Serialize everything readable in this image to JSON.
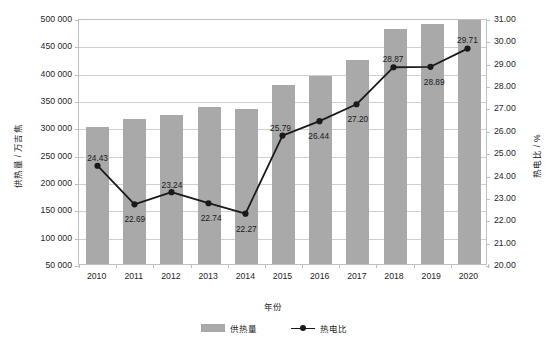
{
  "chart_data": {
    "type": "bar",
    "title": "",
    "xlabel": "年份",
    "ylabel": "供热量 / 万吉焦",
    "y2label": "热电比 / %",
    "categories": [
      "2010",
      "2011",
      "2012",
      "2013",
      "2014",
      "2015",
      "2016",
      "2017",
      "2018",
      "2019",
      "2020"
    ],
    "series": [
      {
        "name": "供热量",
        "type": "bar",
        "axis": "left",
        "color": "#a9a9a9",
        "values": [
          300000,
          315000,
          322000,
          338000,
          334000,
          377000,
          394000,
          424000,
          480000,
          489000,
          497000
        ]
      },
      {
        "name": "热电比",
        "type": "line",
        "axis": "right",
        "color": "#1a1a1a",
        "values": [
          24.43,
          22.69,
          23.24,
          22.74,
          22.27,
          25.79,
          26.44,
          27.2,
          28.87,
          28.89,
          29.71
        ],
        "labels": [
          "24.43",
          "22.69",
          "23.24",
          "22.74",
          "22.27",
          "25.79",
          "26.44",
          "27.20",
          "28.87",
          "28.89",
          "29.71"
        ]
      }
    ],
    "ylim": [
      50000,
      500000
    ],
    "y2lim": [
      20.0,
      31.0
    ],
    "yticks": [
      "50 000",
      "100 000",
      "150 000",
      "200 000",
      "250 000",
      "300 000",
      "350 000",
      "400 000",
      "450 000",
      "500 000"
    ],
    "ytick_values": [
      50000,
      100000,
      150000,
      200000,
      250000,
      300000,
      350000,
      400000,
      450000,
      500000
    ],
    "y2ticks": [
      "20.00",
      "21.00",
      "22.00",
      "23.00",
      "24.00",
      "25.00",
      "26.00",
      "27.00",
      "28.00",
      "29.00",
      "30.00",
      "31.00"
    ],
    "y2tick_values": [
      20,
      21,
      22,
      23,
      24,
      25,
      26,
      27,
      28,
      29,
      30,
      31
    ],
    "grid": true,
    "legend_position": "bottom",
    "legend": [
      "供热量",
      "热电比"
    ]
  },
  "point_label_offsets": [
    {
      "dx": 0,
      "dy": -13
    },
    {
      "dx": 0,
      "dy": 9
    },
    {
      "dx": 0,
      "dy": -13
    },
    {
      "dx": 2,
      "dy": 9
    },
    {
      "dx": 0,
      "dy": 10
    },
    {
      "dx": -3,
      "dy": -13
    },
    {
      "dx": -2,
      "dy": 10
    },
    {
      "dx": 0,
      "dy": 10
    },
    {
      "dx": -2,
      "dy": -13
    },
    {
      "dx": 2,
      "dy": 11
    },
    {
      "dx": -2,
      "dy": -13
    }
  ],
  "colors": {
    "bar": "#a9a9a9",
    "line": "#1a1a1a",
    "grid": "#d0d0d0",
    "frame": "#bfbfbf",
    "text": "#262626",
    "background": "#ffffff"
  }
}
